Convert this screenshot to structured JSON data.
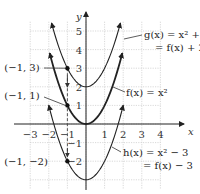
{
  "chart_data": {
    "type": "line",
    "title": "",
    "xlabel": "x",
    "ylabel": "y",
    "xlim": [
      -3,
      4
    ],
    "ylim": [
      -3.5,
      5.5
    ],
    "grid": true,
    "x_ticks": [
      "−3",
      "−2",
      "−1",
      "1",
      "2",
      "3",
      "4"
    ],
    "y_ticks": [
      "5",
      "4",
      "3",
      "2",
      "1",
      "−1",
      "−2"
    ],
    "series": [
      {
        "name": "g(x) = x² + 2 = f(x) + 2",
        "formula": "x^2+2",
        "shift": 2,
        "x_range": [
          -1.85,
          1.85
        ],
        "style": "thin"
      },
      {
        "name": "f(x) = x²",
        "formula": "x^2",
        "shift": 0,
        "x_range": [
          -1.95,
          1.95
        ],
        "style": "bold"
      },
      {
        "name": "h(x) = x² − 3 = f(x) − 3",
        "formula": "x^2-3",
        "shift": -3,
        "x_range": [
          -2.0,
          2.0
        ],
        "style": "thin"
      }
    ],
    "points": [
      {
        "x": -1,
        "y": 3,
        "label": "(−1, 3)"
      },
      {
        "x": -1,
        "y": 1,
        "label": "(−1, 1)"
      },
      {
        "x": -1,
        "y": -2,
        "label": "(−1, −2)"
      }
    ],
    "annotations": {
      "g_line1": "g(x) = x² + 2",
      "g_line2": "= f(x) + 2",
      "f_line1": "f(x) = x²",
      "h_line1": "h(x) = x² − 3",
      "h_line2": "= f(x) − 3"
    },
    "dashed_vertical_at_x": -1
  }
}
